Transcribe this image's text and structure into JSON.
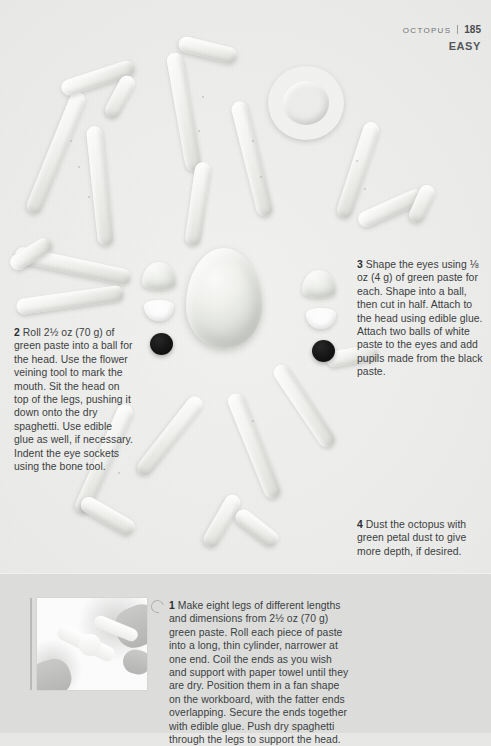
{
  "header": {
    "chapter": "OCTOPUS",
    "page_number": "185",
    "difficulty": "EASY",
    "divider": "|"
  },
  "steps": [
    {
      "id": "step-1",
      "number": "1",
      "text": "Make eight legs of different lengths and dimensions from 2½ oz (70 g) green paste. Roll each piece of paste into a long, thin cylinder, narrower at one end. Coil the ends as you wish and support with paper towel until they are dry. Position them in a fan shape on the workboard, with the fatter ends overlapping. Secure the ends together with edible glue. Push dry spaghetti through the legs to support the head."
    },
    {
      "id": "step-2",
      "number": "2",
      "text": "Roll 2½ oz (70 g) of green paste into a ball for the head. Use the flower veining tool to mark the mouth. Sit the head on top of the legs, pushing it down onto the dry spaghetti. Use edible glue as well, if necessary. Indent the eye sockets using the bone tool."
    },
    {
      "id": "step-3",
      "number": "3",
      "text": "Shape the eyes using ⅛ oz (4 g) of green paste for each. Shape into a ball, then cut in half. Attach to the head using edible glue. Attach two balls of white paste to the eyes and add pupils made from the black paste."
    },
    {
      "id": "step-4",
      "number": "4",
      "text": "Dust the octopus with green petal dust to give more depth, if desired."
    }
  ],
  "figure": {
    "photo_caption": "",
    "photo_alt": "hands rolling green paste into a tapered cylinder",
    "marker_icon": "refresh-arrow-icon"
  },
  "components": {
    "head_label": "octopus-head",
    "eye_dome_label": "green-eye-dome",
    "eye_white_label": "white-eye-ball",
    "pupil_label": "black-pupil",
    "leg_label": "octopus-leg"
  },
  "colors": {
    "paper": "#eaeae8",
    "panel": "#dcdddb",
    "text": "#3b3e41",
    "header_text": "#6f7275",
    "pupil": "#121212",
    "clay_light": "#fdfdfc",
    "clay_shadow": "#dedfdb"
  }
}
